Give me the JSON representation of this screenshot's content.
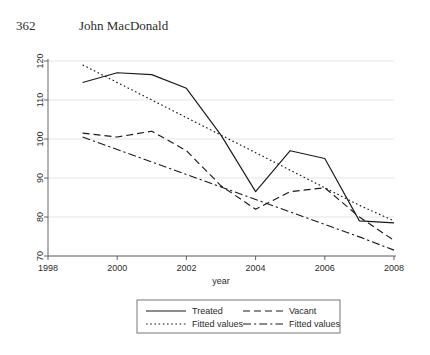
{
  "header": {
    "page_number": "362",
    "author": "John MacDonald"
  },
  "chart_data": {
    "type": "line",
    "title": "",
    "xlabel": "year",
    "ylabel": "",
    "xlim": [
      1998,
      2008
    ],
    "ylim": [
      70,
      120
    ],
    "xticks": [
      "1998",
      "2000",
      "2002",
      "2004",
      "2006",
      "2008"
    ],
    "xtick_values": [
      1998,
      2000,
      2002,
      2004,
      2006,
      2008
    ],
    "yticks": [
      "70",
      "80",
      "90",
      "100",
      "110",
      "120"
    ],
    "ytick_values": [
      70,
      80,
      90,
      100,
      110,
      120
    ],
    "grid": true,
    "legend_position": "below",
    "x": [
      1999,
      2000,
      2001,
      2002,
      2003,
      2004,
      2005,
      2006,
      2007,
      2008
    ],
    "series": [
      {
        "name": "Treated",
        "style": "solid",
        "values": [
          114.5,
          117.0,
          116.5,
          113.0,
          101.0,
          86.5,
          97.0,
          95.0,
          79.0,
          78.5
        ]
      },
      {
        "name": "Vacant",
        "style": "dashed",
        "values": [
          101.5,
          100.5,
          102.0,
          97.0,
          88.0,
          82.0,
          86.5,
          87.5,
          80.0,
          74.0
        ]
      },
      {
        "name": "Fitted values",
        "style": "dotted",
        "values": [
          119.0,
          114.5,
          110.0,
          105.5,
          101.0,
          96.5,
          92.0,
          87.5,
          83.0,
          79.0
        ]
      },
      {
        "name": "Fitted values",
        "style": "dash-dot",
        "values": [
          100.5,
          97.3,
          94.1,
          90.9,
          87.7,
          84.5,
          81.3,
          78.1,
          74.9,
          71.5
        ]
      }
    ],
    "legend": [
      {
        "label": "Treated",
        "style": "solid"
      },
      {
        "label": "Vacant",
        "style": "dashed"
      },
      {
        "label": "Fitted values",
        "style": "dotted"
      },
      {
        "label": "Fitted values",
        "style": "dash-dot"
      }
    ],
    "colors": {
      "line": "#1a1a1a",
      "axis": "#555555",
      "grid": "#d9d9d9",
      "background": "#ffffff"
    }
  }
}
